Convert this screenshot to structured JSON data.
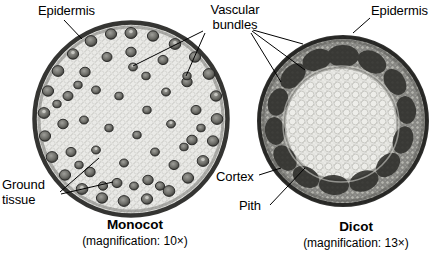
{
  "figure": {
    "background_color": "#ffffff",
    "text_color": "#000000"
  },
  "specimens": [
    {
      "id": "monocot",
      "caption_title": "Monocot",
      "caption_sub": "(magnification: 10×)",
      "magnification": "10×",
      "shape": "circular cross section",
      "interior_color": "#e9e9e6",
      "rim_color": "#2b2b2b",
      "center_x": 131,
      "center_y": 119,
      "radius": 99,
      "description": "Scattered vascular bundles throughout ground tissue",
      "bundle_count": 62
    },
    {
      "id": "dicot",
      "caption_title": "Dicot",
      "caption_sub": "(magnification: 13×)",
      "magnification": "13×",
      "shape": "circular cross section",
      "interior_color": "#9a9a96",
      "pith_color": "#e2e2de",
      "rim_color": "#1f1f1f",
      "center_x": 343,
      "center_y": 121,
      "radius": 86,
      "description": "Vascular bundles arranged in a ring around the pith",
      "bundle_count": 14
    }
  ],
  "labels": [
    {
      "id": "epidermis-left",
      "text": "Epidermis",
      "x": 38,
      "y": 3,
      "align": "left"
    },
    {
      "id": "vascular-bundles",
      "text": "Vascular\nbundles",
      "x": 204,
      "y": 2,
      "align": "center"
    },
    {
      "id": "epidermis-right",
      "text": "Epidermis",
      "x": 371,
      "y": 3,
      "align": "left"
    },
    {
      "id": "ground-tissue",
      "text": "Ground\ntissue",
      "x": 2,
      "y": 177,
      "align": "left"
    },
    {
      "id": "cortex",
      "text": "Cortex",
      "x": 216,
      "y": 169,
      "align": "left"
    },
    {
      "id": "pith",
      "text": "Pith",
      "x": 239,
      "y": 198,
      "align": "left"
    }
  ],
  "captions": [
    {
      "id": "monocot-caption",
      "title": "Monocot",
      "sub": "(magnification: 10×)",
      "center_x": 135,
      "title_y": 217,
      "sub_y": 234
    },
    {
      "id": "dicot-caption",
      "title": "Dicot",
      "sub": "(magnification: 13×)",
      "center_x": 356,
      "title_y": 219,
      "sub_y": 236
    }
  ],
  "leader_lines": [
    {
      "from": "epidermis-left",
      "points": "64,20 82,39"
    },
    {
      "from": "vascular-bundles",
      "points": "203,31 133,66"
    },
    {
      "from": "vascular-bundles",
      "points": "205,33 186,76"
    },
    {
      "from": "vascular-bundles",
      "points": "253,30 303,44"
    },
    {
      "from": "vascular-bundles",
      "points": "252,31 305,70"
    },
    {
      "from": "vascular-bundles",
      "points": "251,33 281,82"
    },
    {
      "from": "epidermis-right",
      "points": "370,18 353,33"
    },
    {
      "from": "ground-tissue",
      "points": "60,192 99,158"
    },
    {
      "from": "ground-tissue",
      "points": "61,194 113,182"
    },
    {
      "from": "cortex",
      "points": "259,175 281,168"
    },
    {
      "from": "pith",
      "points": "270,205 305,168"
    }
  ]
}
